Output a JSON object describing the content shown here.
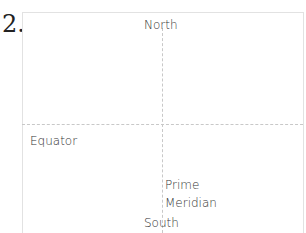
{
  "problem_number": "2.",
  "diagram": {
    "labels": {
      "north": "North",
      "south": "South",
      "equator": "Equator",
      "prime_meridian_line1": "Prime",
      "prime_meridian_line2": "Meridian"
    },
    "colors": {
      "border": "#e2e2e2",
      "dashed_lines": "#c8c8c8",
      "text": "#333333"
    }
  }
}
